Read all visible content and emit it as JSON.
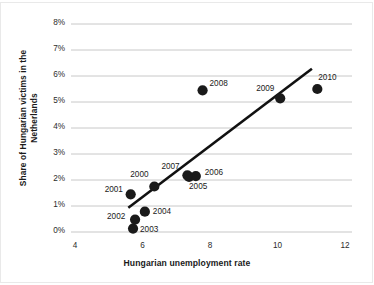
{
  "chart_data": {
    "type": "scatter",
    "title": "",
    "xlabel": "Hungarian unemployment rate",
    "ylabel": "Share of Hungarian victims in the Netherlands",
    "ylabel_lines": [
      "Share of Hungarian victims in the",
      "Netherlands"
    ],
    "xlim": [
      4,
      12
    ],
    "ylim": [
      0,
      8
    ],
    "xticks": [
      4,
      6,
      8,
      10,
      12
    ],
    "xtick_labels": [
      "4",
      "6",
      "8",
      "10",
      "12"
    ],
    "yticks": [
      0,
      1,
      2,
      3,
      4,
      5,
      6,
      7,
      8
    ],
    "ytick_labels": [
      "0%",
      "1%",
      "2%",
      "3%",
      "4%",
      "5%",
      "6%",
      "7%",
      "8%"
    ],
    "grid": "horizontal",
    "legend": "none",
    "marker_color": "#1a1a1a",
    "gridline_color": "#c8c8c8",
    "trendline_color": "#111111",
    "points": [
      {
        "label": "2000",
        "x": 6.35,
        "y": 1.75,
        "label_dx": -24,
        "label_dy": -12
      },
      {
        "label": "2001",
        "x": 5.65,
        "y": 1.45,
        "label_dx": -26,
        "label_dy": -4
      },
      {
        "label": "2002",
        "x": 5.78,
        "y": 0.48,
        "label_dx": -28,
        "label_dy": -3
      },
      {
        "label": "2003",
        "x": 5.72,
        "y": 0.13,
        "label_dx": 7,
        "label_dy": 1
      },
      {
        "label": "2004",
        "x": 6.07,
        "y": 0.78,
        "label_dx": 8,
        "label_dy": 0
      },
      {
        "label": "2005",
        "x": 7.38,
        "y": 2.12,
        "label_dx": 0,
        "label_dy": 10
      },
      {
        "label": "2006",
        "x": 7.58,
        "y": 2.15,
        "label_dx": 9,
        "label_dy": -3
      },
      {
        "label": "2007",
        "x": 7.33,
        "y": 2.18,
        "label_dx": -26,
        "label_dy": -8
      },
      {
        "label": "2008",
        "x": 7.78,
        "y": 5.45,
        "label_dx": 7,
        "label_dy": -6
      },
      {
        "label": "2009",
        "x": 10.08,
        "y": 5.14,
        "label_dx": -24,
        "label_dy": -9
      },
      {
        "label": "2010",
        "x": 11.18,
        "y": 5.5,
        "label_dx": 1,
        "label_dy": -11
      }
    ],
    "trendline": {
      "x0": 5.58,
      "y0": 0.93,
      "x1": 11.02,
      "y1": 6.28
    }
  }
}
